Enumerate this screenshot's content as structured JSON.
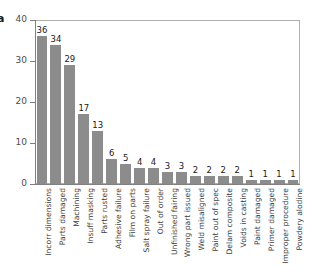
{
  "panel": {
    "label": "a"
  },
  "chart_data": {
    "type": "bar",
    "title": "",
    "subtitle": "",
    "xlabel": "",
    "ylabel": "",
    "ylim": [
      0,
      40
    ],
    "yticks": [
      0,
      10,
      20,
      30,
      40
    ],
    "grid": false,
    "legend": null,
    "bar_color": "#8c8c8c",
    "axis_color": "#808080",
    "value_labels_shown": true,
    "categories": [
      "Incorr dimensions",
      "Parts damaged",
      "Machining",
      "Insuff masking",
      "Parts rusted",
      "Adhesive failure",
      "Film on parts",
      "Salt spray failure",
      "Out of order",
      "Unfinished fairing",
      "Wrong part issued",
      "Weld misaligned",
      "Paint out of spec",
      "Delam composite",
      "Voids in casting",
      "Paint damaged",
      "Primer damaged",
      "Improper procedure",
      "Powdery alodine"
    ],
    "values": [
      36,
      34,
      29,
      17,
      13,
      6,
      5,
      4,
      4,
      3,
      3,
      2,
      2,
      2,
      2,
      1,
      1,
      1,
      1
    ]
  }
}
